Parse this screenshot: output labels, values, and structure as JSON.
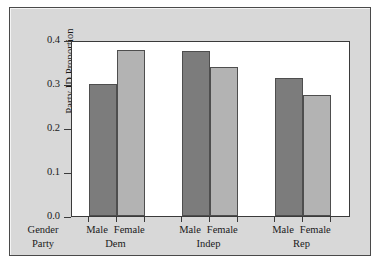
{
  "chart_data": {
    "type": "bar",
    "title": "",
    "xlabel": "",
    "ylabel": "Party ID Proportion",
    "ylim": [
      0.0,
      0.4
    ],
    "yticks": [
      "0.0",
      "0.1",
      "0.2",
      "0.3",
      "0.4"
    ],
    "ytick_values": [
      0.0,
      0.1,
      0.2,
      0.3,
      0.4
    ],
    "grid": false,
    "legend": "none",
    "row_labels": [
      "Gender",
      "Party"
    ],
    "categories": [
      "Dem",
      "Indep",
      "Rep"
    ],
    "series": [
      {
        "name": "Male",
        "color": "#7c7c7c",
        "values": [
          0.301,
          0.375,
          0.313
        ]
      },
      {
        "name": "Female",
        "color": "#b3b3b3",
        "values": [
          0.378,
          0.338,
          0.274
        ]
      }
    ],
    "groups": [
      {
        "party": "Dem",
        "bars": [
          {
            "gender": "Male",
            "value": 0.301
          },
          {
            "gender": "Female",
            "value": 0.378
          }
        ]
      },
      {
        "party": "Indep",
        "bars": [
          {
            "gender": "Male",
            "value": 0.375
          },
          {
            "gender": "Female",
            "value": 0.338
          }
        ]
      },
      {
        "party": "Rep",
        "bars": [
          {
            "gender": "Male",
            "value": 0.313
          },
          {
            "gender": "Female",
            "value": 0.274
          }
        ]
      }
    ]
  },
  "panel": {
    "background_color": "#d8d8d8",
    "plot_background_color": "#ffffff",
    "border_color": "#4a4a4a"
  }
}
